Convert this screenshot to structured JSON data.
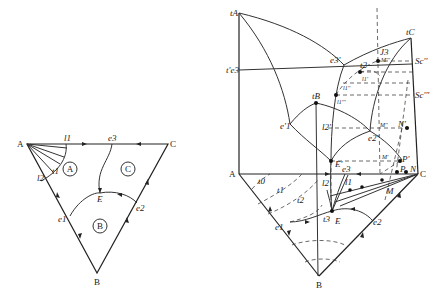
{
  "left_diagram": {
    "vertices": {
      "A": "A",
      "B": "B",
      "C": "C"
    },
    "points": {
      "e1": "e1",
      "e2": "e2",
      "e3": "e3",
      "E": "E",
      "l1": "l1",
      "l2": "l2",
      "t1": "t1"
    },
    "regions": {
      "A": "A",
      "B": "B",
      "C": "C"
    }
  },
  "right_diagram": {
    "vertices": {
      "A": "A",
      "B": "B",
      "C": "C"
    },
    "temperature_labels": {
      "tA": "tA",
      "tC": "tC",
      "tB": "tB",
      "te3": "t'e3"
    },
    "prism_points": {
      "e3p": "e3'",
      "e1p": "e'1",
      "e2p": "e2'",
      "Ep": "E'",
      "t2_top": "t2",
      "J3": "J3",
      "Mppp": "M'''",
      "Sc2": "Sc''",
      "Sc3": "Sc'''",
      "l1pp": "l1''",
      "l1p_upper": "l1'",
      "l1ppp": "l1'''",
      "l2p": "l2'",
      "Mpp": "M''",
      "Np": "N'",
      "Mp": "M'",
      "Pp": "P'",
      "P": "P",
      "N": "N"
    },
    "base_points": {
      "e1": "e1",
      "e2": "e2",
      "e3": "e3",
      "E": "E",
      "M": "M",
      "t0": "t0",
      "t1": "t1",
      "t2": "t2",
      "t3": "t3",
      "l1": "l1",
      "l2": "l2"
    }
  }
}
